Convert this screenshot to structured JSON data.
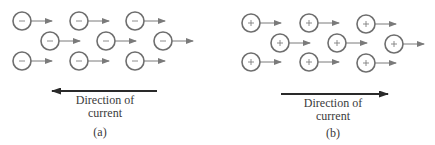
{
  "colors": {
    "particle_stroke": "#6e6e6e",
    "drift_arrow": "#7a7a7a",
    "current_arrow": "#2a2a2a",
    "text": "#3a3a3a"
  },
  "panels": [
    {
      "id": "a",
      "label": "(a)",
      "charge_type": "negative",
      "charge_symbol": "−",
      "particle_drift_direction": "right",
      "current_direction": "left",
      "caption_line1": "Direction of",
      "caption_line2": "current",
      "particles": [
        {
          "x": 22,
          "y": 21
        },
        {
          "x": 79,
          "y": 21
        },
        {
          "x": 135,
          "y": 21
        },
        {
          "x": 50,
          "y": 41
        },
        {
          "x": 106,
          "y": 41
        },
        {
          "x": 163,
          "y": 41
        },
        {
          "x": 22,
          "y": 61
        },
        {
          "x": 79,
          "y": 61
        },
        {
          "x": 135,
          "y": 61
        }
      ],
      "current_arrow": {
        "x1": 157,
        "x2": 52,
        "y": 91
      }
    },
    {
      "id": "b",
      "label": "(b)",
      "charge_type": "positive",
      "charge_symbol": "+",
      "particle_drift_direction": "right",
      "current_direction": "right",
      "caption_line1": "Direction of",
      "caption_line2": "current",
      "particles": [
        {
          "x": 251,
          "y": 23
        },
        {
          "x": 309,
          "y": 23
        },
        {
          "x": 366,
          "y": 24
        },
        {
          "x": 280,
          "y": 43
        },
        {
          "x": 337,
          "y": 43
        },
        {
          "x": 394,
          "y": 44
        },
        {
          "x": 251,
          "y": 62
        },
        {
          "x": 309,
          "y": 62
        },
        {
          "x": 366,
          "y": 63
        }
      ],
      "current_arrow": {
        "x1": 281,
        "x2": 388,
        "y": 94
      }
    }
  ]
}
